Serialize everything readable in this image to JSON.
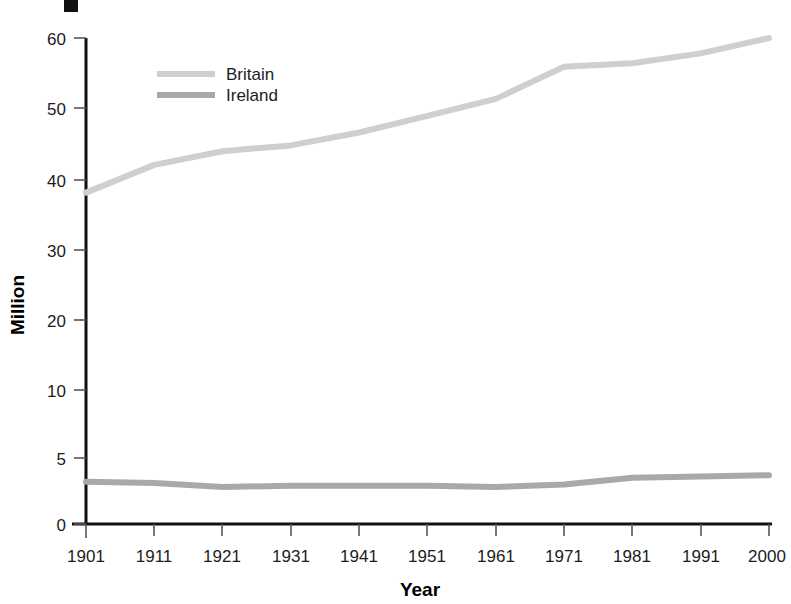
{
  "chart_data": {
    "type": "line",
    "title": "",
    "xlabel": "Year",
    "ylabel": "Million",
    "x": [
      1901,
      1911,
      1921,
      1931,
      1941,
      1951,
      1961,
      1971,
      1981,
      1991,
      2000
    ],
    "categories": [
      "1901",
      "1911",
      "1921",
      "1931",
      "1941",
      "1951",
      "1961",
      "1971",
      "1981",
      "1991",
      "2000"
    ],
    "xtick_labels": [
      "1901",
      "1911",
      "1921",
      "1931",
      "1941",
      "1951",
      "1961",
      "1971",
      "1981",
      "1991",
      "2000"
    ],
    "ytick_labels": [
      "0",
      "5",
      "10",
      "20",
      "30",
      "40",
      "50",
      "60"
    ],
    "ytick_values": [
      0,
      5,
      10,
      20,
      30,
      40,
      50,
      60
    ],
    "yaxis_scale": "non-linear (0, 5, 10 then decades at equal spacing)",
    "ylim": [
      0,
      60
    ],
    "xlim": [
      1901,
      2000
    ],
    "grid": false,
    "legend_position": "upper-left inside plot",
    "series": [
      {
        "name": "Britain",
        "color": "#cfcfcf",
        "values": [
          38.2,
          42.1,
          44.0,
          44.8,
          46.6,
          48.9,
          51.3,
          55.9,
          56.4,
          57.8,
          60.0
        ]
      },
      {
        "name": "Ireland",
        "color": "#a9a9a9",
        "values": [
          3.2,
          3.1,
          2.8,
          2.9,
          2.9,
          2.9,
          2.8,
          3.0,
          3.5,
          3.6,
          3.7
        ]
      }
    ]
  },
  "legend": {
    "entries": [
      {
        "label": "Britain",
        "swatch_color": "#cfcfcf"
      },
      {
        "label": "Ireland",
        "swatch_color": "#a9a9a9"
      }
    ]
  },
  "axes": {
    "y_title": "Million",
    "x_title": "Year",
    "y_ticks": [
      "60",
      "50",
      "40",
      "30",
      "20",
      "10",
      "5",
      "0"
    ],
    "x_ticks": [
      "1901",
      "1911",
      "1921",
      "1931",
      "1941",
      "1951",
      "1961",
      "1971",
      "1981",
      "1991",
      "2000"
    ]
  },
  "marks": {
    "corner_square": "black-square-marker"
  }
}
